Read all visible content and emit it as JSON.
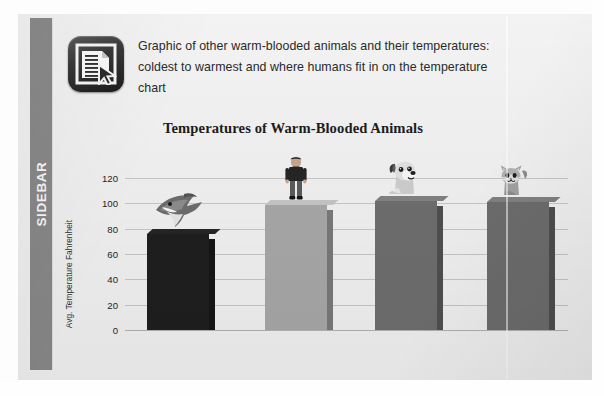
{
  "sidebar": {
    "label": "SIDEBAR",
    "color": "#8a8a8a"
  },
  "header": {
    "icon_name": "document-cursor-icon",
    "caption": "Graphic of other warm-blooded animals and their temperatures: coldest to warmest and where humans fit in on the temperature chart"
  },
  "slide": {
    "background": "#f3f3f3"
  },
  "chart_data": {
    "type": "bar",
    "title": "Temperatures of Warm-Blooded Animals",
    "xlabel": "",
    "ylabel": "Avg. Temperature Fahrenheit",
    "ylim": [
      0,
      120
    ],
    "ytick_step": 20,
    "yticks": [
      "120",
      "100",
      "80",
      "60",
      "40",
      "20",
      "0"
    ],
    "grid": true,
    "legend": "none",
    "categories": [
      "Shark",
      "Human",
      "Dog",
      "Cat"
    ],
    "values": [
      76,
      98.6,
      102,
      101
    ],
    "bar_colors": [
      "#1f1f1f",
      "#a9a9a9",
      "#6f6f6f",
      "#6e6e6e"
    ],
    "icons": [
      "shark-icon",
      "human-icon",
      "dog-icon",
      "cat-icon"
    ],
    "annotations": [
      "Shark bar topped by a shark illustration",
      "Human bar topped by a standing person illustration",
      "Dog bar topped by a sitting dog illustration",
      "Cat bar topped by a sitting cat illustration"
    ]
  }
}
